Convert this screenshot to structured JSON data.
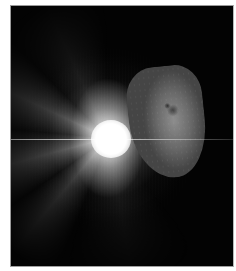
{
  "image": {
    "subject": "Comet nucleus with bright impact flash and radiating ejecta rays",
    "description": "Grayscale space photograph: irregular cratered comet nucleus on the right, brilliant white impact flash to its left with a horizontal light streak and diffuse rays against a black background",
    "colors": {
      "background": "#030303",
      "border": "#9a9a9a",
      "flash": "#ffffff",
      "nucleus": "#7a7a7a"
    }
  }
}
